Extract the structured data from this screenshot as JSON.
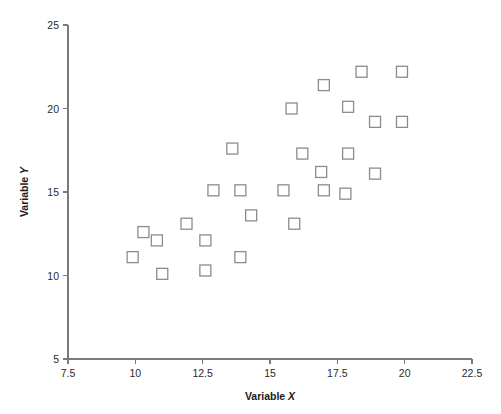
{
  "chart_data": {
    "type": "scatter",
    "title": "",
    "xlabel": "Variable X",
    "ylabel": "Variable Y",
    "xlim": [
      7.5,
      22.5
    ],
    "ylim": [
      5,
      25
    ],
    "xticks": [
      "7.5",
      "10",
      "12.5",
      "15",
      "17.5",
      "20",
      "22.5"
    ],
    "xtick_values": [
      7.5,
      10,
      12.5,
      15,
      17.5,
      20,
      22.5
    ],
    "yticks": [
      "5",
      "10",
      "15",
      "20",
      "25"
    ],
    "ytick_values": [
      5,
      10,
      15,
      20,
      25
    ],
    "grid": false,
    "legend": null,
    "marker": "open-square",
    "marker_color": "#8c8c8c",
    "background_color": "#ffffff",
    "axis_color": "#7a7a7a",
    "n_points": 30,
    "points": [
      {
        "x": 9.9,
        "y": 11.1
      },
      {
        "x": 10.3,
        "y": 12.6
      },
      {
        "x": 10.8,
        "y": 12.1
      },
      {
        "x": 11.0,
        "y": 10.1
      },
      {
        "x": 11.9,
        "y": 13.1
      },
      {
        "x": 12.6,
        "y": 10.3
      },
      {
        "x": 12.6,
        "y": 12.1
      },
      {
        "x": 12.9,
        "y": 15.1
      },
      {
        "x": 13.6,
        "y": 17.6
      },
      {
        "x": 13.9,
        "y": 11.1
      },
      {
        "x": 13.9,
        "y": 15.1
      },
      {
        "x": 14.3,
        "y": 13.6
      },
      {
        "x": 15.5,
        "y": 15.1
      },
      {
        "x": 15.8,
        "y": 20.0
      },
      {
        "x": 15.9,
        "y": 13.1
      },
      {
        "x": 16.2,
        "y": 17.3
      },
      {
        "x": 16.9,
        "y": 16.2
      },
      {
        "x": 17.0,
        "y": 15.1
      },
      {
        "x": 17.0,
        "y": 21.4
      },
      {
        "x": 17.8,
        "y": 14.9
      },
      {
        "x": 17.9,
        "y": 17.3
      },
      {
        "x": 17.9,
        "y": 20.1
      },
      {
        "x": 18.4,
        "y": 22.2
      },
      {
        "x": 18.9,
        "y": 16.1
      },
      {
        "x": 18.9,
        "y": 19.2
      },
      {
        "x": 19.9,
        "y": 19.2
      },
      {
        "x": 19.9,
        "y": 22.2
      }
    ]
  },
  "labels": {
    "x_title_prefix": "Variable ",
    "x_title_var": "X",
    "y_title_prefix": "Variable ",
    "y_title_var": "Y"
  }
}
